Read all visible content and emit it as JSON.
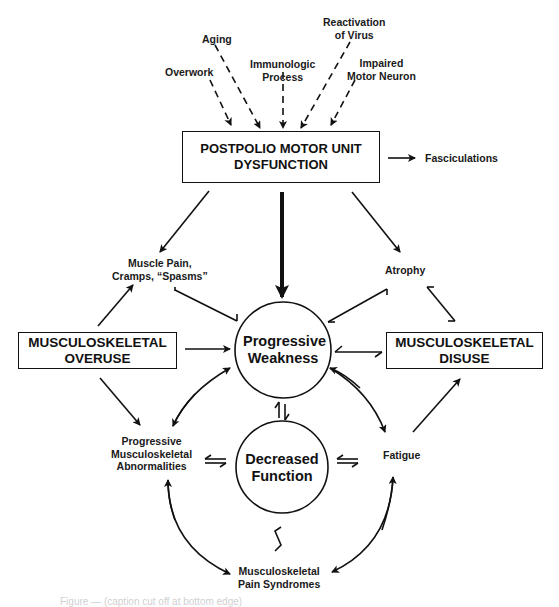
{
  "diagram": {
    "causes": [
      {
        "id": "aging",
        "label": "Aging"
      },
      {
        "id": "overwork",
        "label": "Overwork"
      },
      {
        "id": "immunologic",
        "line1": "Immunologic",
        "line2": "Process"
      },
      {
        "id": "reactivation",
        "line1": "Reactivation",
        "line2": "of Virus"
      },
      {
        "id": "impaired",
        "line1": "Impaired",
        "line2": "Motor Neuron"
      }
    ],
    "main_box": {
      "line1": "POSTPOLIO MOTOR UNIT",
      "line2": "DYSFUNCTION"
    },
    "fasciculations": "Fasciculations",
    "muscle_pain": {
      "line1": "Muscle Pain,",
      "line2": "Cramps, “Spasms”"
    },
    "atrophy": "Atrophy",
    "overuse_box": {
      "line1": "MUSCULOSKELETAL",
      "line2": "OVERUSE"
    },
    "disuse_box": {
      "line1": "MUSCULOSKELETAL",
      "line2": "DISUSE"
    },
    "progressive_weakness": {
      "line1": "Progressive",
      "line2": "Weakness"
    },
    "decreased_function": {
      "line1": "Decreased",
      "line2": "Function"
    },
    "abnormalities": {
      "line1": "Progressive",
      "line2": "Musculoskeletal",
      "line3": "Abnormalities"
    },
    "fatigue": "Fatigue",
    "pain_syndromes": {
      "line1": "Musculoskeletal",
      "line2": "Pain Syndromes"
    },
    "caption_partial": "Figure — (caption cut off at bottom edge)",
    "colors": {
      "stroke": "#111111",
      "background": "#ffffff"
    }
  }
}
